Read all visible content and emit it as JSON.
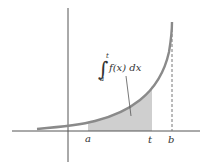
{
  "diagram": {
    "type": "improper-integral-illustration",
    "colors": {
      "background": "#ffffff",
      "axes": "#555555",
      "curve": "#8a8a8a",
      "shade": "#cfcfcf",
      "text": "#333333"
    },
    "labels": {
      "a": "a",
      "t": "t",
      "b": "b",
      "integral_sign": "∫",
      "upper_limit": "t",
      "lower_limit": "a",
      "integrand": "f(x) dx"
    },
    "annotation": "Shaded area between a and t under f(x); vertical dashed asymptote at x = b"
  }
}
